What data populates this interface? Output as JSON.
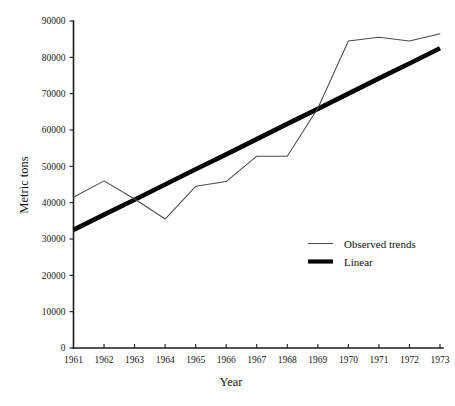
{
  "chart_data": {
    "type": "line",
    "title": "",
    "xlabel": "Year",
    "ylabel": "Metric tons",
    "x": [
      1961,
      1962,
      1963,
      1964,
      1965,
      1966,
      1967,
      1968,
      1969,
      1970,
      1971,
      1972,
      1973
    ],
    "categories": [
      "1961",
      "1962",
      "1963",
      "1964",
      "1965",
      "1966",
      "1967",
      "1968",
      "1969",
      "1970",
      "1971",
      "1972",
      "1973"
    ],
    "xlim": [
      1961,
      1973
    ],
    "ylim": [
      0,
      90000
    ],
    "ytick_labels": [
      "0",
      "10000",
      "20000",
      "30000",
      "40000",
      "50000",
      "60000",
      "70000",
      "80000",
      "90000"
    ],
    "ytick_values": [
      0,
      10000,
      20000,
      30000,
      40000,
      50000,
      60000,
      70000,
      80000,
      90000
    ],
    "xtick_labels": [
      "1961",
      "1962",
      "1963",
      "1964",
      "1965",
      "1966",
      "1967",
      "1968",
      "1969",
      "1970",
      "1971",
      "1972",
      "1973"
    ],
    "grid": false,
    "legend_position": "center-right",
    "series": [
      {
        "name": "Observed trends",
        "style": "thin-line",
        "color": "#4a4a4a",
        "values": [
          41500,
          46000,
          41000,
          35500,
          44500,
          45800,
          52800,
          52800,
          66000,
          84500,
          85500,
          84500,
          86500
        ]
      },
      {
        "name": "Linear",
        "style": "thick-line",
        "color": "#050505",
        "values": [
          32500,
          36700,
          40800,
          45000,
          49200,
          53300,
          57500,
          61700,
          65800,
          70000,
          74200,
          78300,
          82500
        ]
      }
    ],
    "legend": [
      {
        "label": "Observed trends",
        "swatch": "thin-line"
      },
      {
        "label": "Linear",
        "swatch": "thick-line"
      }
    ]
  }
}
